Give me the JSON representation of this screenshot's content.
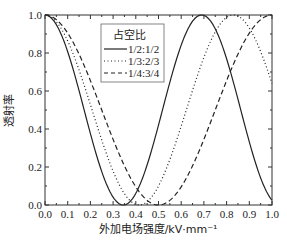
{
  "chart_data": {
    "type": "line",
    "title": "",
    "xlabel": "外加电场强度/kV·mm⁻¹",
    "ylabel": "透射率",
    "xlim": [
      0.0,
      1.0
    ],
    "ylim": [
      0.0,
      1.0
    ],
    "x_ticks": [
      "0.0",
      "0.1",
      "0.2",
      "0.3",
      "0.4",
      "0.5",
      "0.6",
      "0.7",
      "0.8",
      "0.9",
      "1.0"
    ],
    "y_ticks": [
      "0.0",
      "0.2",
      "0.4",
      "0.6",
      "0.8",
      "1.0"
    ],
    "grid": false,
    "legend": {
      "title": "占空比",
      "position": "upper-left-center"
    },
    "series": [
      {
        "name": "1/2:1/2",
        "style": "solid",
        "min_at": 0.345,
        "max_at": 0.69,
        "x": [
          0.0,
          0.1,
          0.2,
          0.3,
          0.345,
          0.4,
          0.5,
          0.6,
          0.69,
          0.8,
          0.9,
          1.0
        ],
        "y": [
          1.0,
          0.62,
          0.06,
          0.04,
          0.0,
          0.06,
          0.54,
          0.96,
          1.0,
          0.78,
          0.3,
          0.0
        ]
      },
      {
        "name": "1/3:2/3",
        "style": "dotted",
        "min_at": 0.415,
        "max_at": 0.83,
        "x": [
          0.0,
          0.1,
          0.2,
          0.3,
          0.415,
          0.5,
          0.6,
          0.7,
          0.83,
          0.9,
          1.0
        ],
        "y": [
          1.0,
          0.73,
          0.29,
          0.0,
          0.0,
          0.07,
          0.38,
          0.76,
          1.0,
          0.93,
          0.6
        ]
      },
      {
        "name": "1/4:3/4",
        "style": "dashed",
        "min_at": 0.5,
        "max_at": 1.0,
        "x": [
          0.0,
          0.1,
          0.2,
          0.3,
          0.4,
          0.5,
          0.6,
          0.7,
          0.8,
          0.9,
          1.0
        ],
        "y": [
          1.0,
          0.9,
          0.65,
          0.35,
          0.1,
          0.0,
          0.1,
          0.35,
          0.65,
          0.9,
          1.0
        ]
      }
    ]
  }
}
